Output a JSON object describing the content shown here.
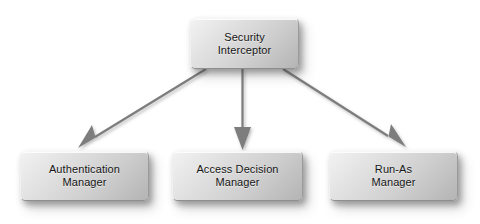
{
  "diagram": {
    "background_color": "#ffffff",
    "edge_color": "#7d7d7d",
    "node_fill_light": "#f2f2f2",
    "node_fill_dark": "#b4b4b4",
    "node_text_color": "#161616",
    "nodes": [
      {
        "id": "security-interceptor",
        "label": "Security\nInterceptor",
        "line1": "Security",
        "line2": "Interceptor",
        "role": "root"
      },
      {
        "id": "authentication-manager",
        "label": "Authentication\nManager",
        "line1": "Authentication",
        "line2": "Manager",
        "role": "child"
      },
      {
        "id": "access-decision-manager",
        "label": "Access Decision\nManager",
        "line1": "Access Decision",
        "line2": "Manager",
        "role": "child"
      },
      {
        "id": "run-as-manager",
        "label": "Run-As\nManager",
        "line1": "Run-As",
        "line2": "Manager",
        "role": "child"
      }
    ],
    "edges": [
      {
        "id": "edge-to-authentication-manager",
        "from": "security-interceptor",
        "to": "authentication-manager",
        "arrowhead": "filled-triangle"
      },
      {
        "id": "edge-to-access-decision-manager",
        "from": "security-interceptor",
        "to": "access-decision-manager",
        "arrowhead": "filled-triangle"
      },
      {
        "id": "edge-to-run-as-manager",
        "from": "security-interceptor",
        "to": "run-as-manager",
        "arrowhead": "filled-triangle"
      }
    ]
  }
}
